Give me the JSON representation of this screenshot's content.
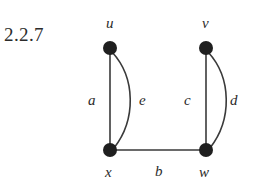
{
  "figure": {
    "exercise_number": "2.2.7",
    "vertices": [
      {
        "id": "u",
        "label": "u",
        "cx": 110,
        "cy": 48,
        "r": 7,
        "label_x": 106,
        "label_y": 28
      },
      {
        "id": "v",
        "label": "v",
        "cx": 206,
        "cy": 48,
        "r": 7,
        "label_x": 202,
        "label_y": 28
      },
      {
        "id": "x",
        "label": "x",
        "cx": 110,
        "cy": 150,
        "r": 7,
        "label_x": 105,
        "label_y": 177
      },
      {
        "id": "w",
        "label": "w",
        "cx": 206,
        "cy": 150,
        "r": 7,
        "label_x": 199,
        "label_y": 177
      }
    ],
    "edges": [
      {
        "id": "a",
        "label": "a",
        "from": "u",
        "to": "x",
        "shape": "straight",
        "path": "M 110 48 L 110 150",
        "label_x": 88,
        "label_y": 105
      },
      {
        "id": "e",
        "label": "e",
        "from": "u",
        "to": "x",
        "shape": "curved",
        "path": "M 112 52 C 136 78 136 120 114 148",
        "label_x": 139,
        "label_y": 105
      },
      {
        "id": "c",
        "label": "c",
        "from": "v",
        "to": "w",
        "shape": "straight",
        "path": "M 206 48 L 206 150",
        "label_x": 184,
        "label_y": 105
      },
      {
        "id": "d",
        "label": "d",
        "from": "v",
        "to": "w",
        "shape": "curved",
        "path": "M 208 52 C 232 78 232 120 210 148",
        "label_x": 230,
        "label_y": 105
      },
      {
        "id": "b",
        "label": "b",
        "from": "x",
        "to": "w",
        "shape": "straight",
        "path": "M 110 150 L 206 150",
        "label_x": 155,
        "label_y": 176
      }
    ],
    "colors": {
      "vertex_fill": "#1f1f1f",
      "edge_stroke": "#3a3a3a",
      "text": "#2b2b2b",
      "background": "#ffffff"
    }
  }
}
